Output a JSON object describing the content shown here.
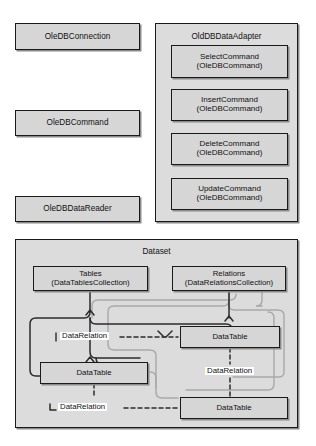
{
  "diagram": {
    "colors": {
      "box_fill": "#d6d6d6",
      "panel_fill": "#dcdcdc",
      "border": "#1a1a1a",
      "shadow": "#8a8a8a",
      "connector_dark": "#2b2b2b",
      "connector_light": "#a8a8a8",
      "label_bg": "#ffffff"
    },
    "provider_section": {
      "standalone_boxes": [
        {
          "id": "oledbconnection",
          "label": "OleDBConnection"
        },
        {
          "id": "oledbcommand",
          "label": "OleDBCommand"
        },
        {
          "id": "oledbdatareader",
          "label": "OleDBDataReader"
        }
      ],
      "adapter_panel": {
        "title": "OldDBDataAdapter",
        "commands": [
          {
            "id": "selectcommand",
            "name": "SelectCommand",
            "type": "(OleDBCommand)"
          },
          {
            "id": "insertcommand",
            "name": "InsertCommand",
            "type": "(OleDBCommand)"
          },
          {
            "id": "deletecommand",
            "name": "DeleteCommand",
            "type": "(OleDBCommand)"
          },
          {
            "id": "updatecommand",
            "name": "UpdateCommand",
            "type": "(OleDBCommand)"
          }
        ]
      }
    },
    "dataset_section": {
      "title": "Dataset",
      "collections": [
        {
          "id": "tables",
          "name": "Tables",
          "type": "(DataTablesCollection)"
        },
        {
          "id": "relations",
          "name": "Relations",
          "type": "(DataRelationsCollection)"
        }
      ],
      "tables": [
        {
          "id": "datatable-1",
          "label": "DataTable"
        },
        {
          "id": "datatable-2",
          "label": "DataTable"
        },
        {
          "id": "datatable-3",
          "label": "DataTable"
        }
      ],
      "relations": [
        {
          "id": "datarelation-1",
          "label": "DataRelation"
        },
        {
          "id": "datarelation-2",
          "label": "DataRelation"
        },
        {
          "id": "datarelation-3",
          "label": "DataRelation"
        }
      ]
    }
  }
}
